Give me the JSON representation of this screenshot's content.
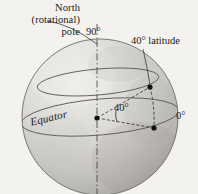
{
  "figure": {
    "background_color": "#f4f2ee",
    "sphere": {
      "center_x": 100,
      "center_y": 117,
      "radius": 78,
      "fill_light": "#e8e6e2",
      "fill_mid": "#c9c7c3",
      "fill_dark": "#a9a7a3",
      "outline_color": "#6e6c68"
    },
    "labels": {
      "pole_line1": "North",
      "pole_line2": "(rotational)",
      "pole_line3": "pole",
      "pole_full": "North (rotational) pole",
      "pole_angle": "90°",
      "latitude_callout": "40° latitude",
      "prime_meridian": "0°",
      "angle_value": "40°",
      "equator": "Equator"
    },
    "geometry": {
      "axis_label": "rotational-axis",
      "equator_label": "equator-circle",
      "latitude_circle_label": "40-degree-latitude-circle",
      "center_point_label": "earth-center-point",
      "latitude_point_label": "point-at-40-latitude",
      "equator_point_label": "point-at-equator",
      "angle_arc_label": "40-degree-angle-arc"
    },
    "colors": {
      "line": "#3a3a3a",
      "dashed": "#2a2a2a",
      "text": "#1a1a1a",
      "curve": "#5a5854"
    }
  }
}
